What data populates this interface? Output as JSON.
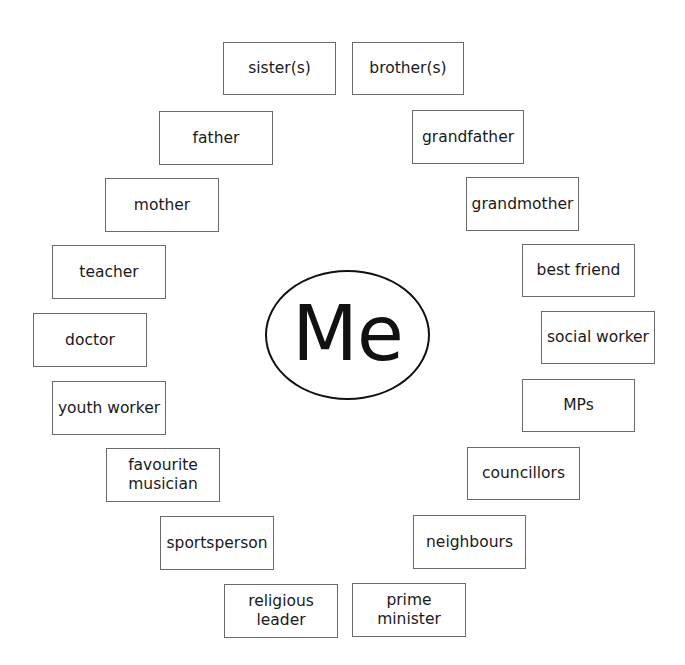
{
  "center": {
    "label": "Me"
  },
  "boxes": [
    {
      "label": "sister(s)",
      "x": 223,
      "y": 42,
      "w": 113,
      "h": 53
    },
    {
      "label": "brother(s)",
      "x": 352,
      "y": 42,
      "w": 112,
      "h": 53
    },
    {
      "label": "father",
      "x": 159,
      "y": 111,
      "w": 114,
      "h": 54
    },
    {
      "label": "grandfather",
      "x": 412,
      "y": 110,
      "w": 112,
      "h": 54
    },
    {
      "label": "mother",
      "x": 105,
      "y": 178,
      "w": 114,
      "h": 54
    },
    {
      "label": "grandmother",
      "x": 466,
      "y": 177,
      "w": 113,
      "h": 54
    },
    {
      "label": "teacher",
      "x": 52,
      "y": 245,
      "w": 114,
      "h": 54
    },
    {
      "label": "best friend",
      "x": 522,
      "y": 244,
      "w": 113,
      "h": 53
    },
    {
      "label": "doctor",
      "x": 33,
      "y": 313,
      "w": 114,
      "h": 54
    },
    {
      "label": "social worker",
      "x": 541,
      "y": 311,
      "w": 114,
      "h": 53
    },
    {
      "label": "youth worker",
      "x": 52,
      "y": 381,
      "w": 114,
      "h": 54
    },
    {
      "label": "MPs",
      "x": 522,
      "y": 379,
      "w": 113,
      "h": 53
    },
    {
      "label": "favourite\nmusician",
      "x": 106,
      "y": 448,
      "w": 114,
      "h": 54
    },
    {
      "label": "councillors",
      "x": 467,
      "y": 447,
      "w": 113,
      "h": 53
    },
    {
      "label": "sportsperson",
      "x": 160,
      "y": 516,
      "w": 114,
      "h": 54
    },
    {
      "label": "neighbours",
      "x": 413,
      "y": 515,
      "w": 113,
      "h": 54
    },
    {
      "label": "religious\nleader",
      "x": 224,
      "y": 584,
      "w": 114,
      "h": 54
    },
    {
      "label": "prime\nminister",
      "x": 352,
      "y": 583,
      "w": 114,
      "h": 54
    }
  ]
}
